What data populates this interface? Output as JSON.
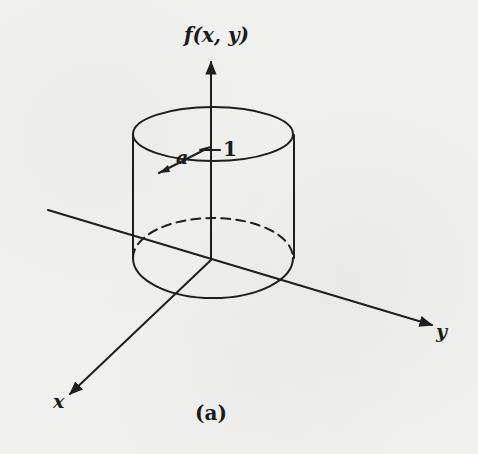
{
  "figure": {
    "vertical_axis_label": "f(x, y)",
    "x_axis_label": "x",
    "y_axis_label": "y",
    "radius_label": "a",
    "height_label": "1",
    "caption": "(a)"
  },
  "colors": {
    "background": "#f1f1ef",
    "ink": "#1e1e1e"
  },
  "geometry": {
    "shape": "cylinder",
    "radius_symbol": "a",
    "height_value": 1
  }
}
